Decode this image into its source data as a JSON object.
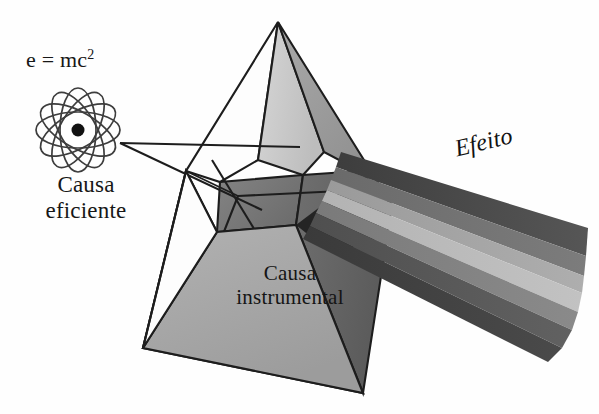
{
  "figure": {
    "background_color": "#fefefe",
    "line_color": "#1a1a1a",
    "text_color": "#171717"
  },
  "labels": {
    "formula_base": "e = mc",
    "formula_exponent": "2",
    "cause_line1": "Causa",
    "cause_line2": "eficiente",
    "instrumental_line1": "Causa",
    "instrumental_line2": "instrumental",
    "effect": "Efeito"
  },
  "atom": {
    "icon": "atom-icon",
    "center_x": 78,
    "center_y": 130,
    "orbit_count": 6,
    "orbit_rx": 42,
    "orbit_ry": 18,
    "orbit_color": "#3d3d3d",
    "nucleus_radius": 6.5,
    "nucleus_color": "#111111"
  },
  "prism": {
    "apex_x": 278,
    "apex_y": 22,
    "base_left_x": 143,
    "base_left_y": 348,
    "base_right_x": 363,
    "base_right_y": 393,
    "faces": [
      {
        "name": "upper-left-facet",
        "fill": "#ffffff"
      },
      {
        "name": "upper-mid-facet",
        "fill": "#c9c9c9"
      },
      {
        "name": "upper-right-facet",
        "fill": "#9a9a9a"
      },
      {
        "name": "mid-dark-facet",
        "fill": "#7a7a7a"
      },
      {
        "name": "front-base-facet",
        "fill": "#a8a8a8"
      },
      {
        "name": "left-white-facet",
        "fill": "#fdfdfd"
      },
      {
        "name": "shadow-facet",
        "fill": "#2b2b2b"
      }
    ]
  },
  "incident_ray": {
    "name": "incident-light-ray",
    "origin_x": 120,
    "origin_y": 143,
    "color": "#1a1a1a"
  },
  "spectrum_beam": {
    "name": "dispersed-spectrum-beam",
    "band_count": 6,
    "bands": [
      {
        "index": 0,
        "fill": "#4a4a4a"
      },
      {
        "index": 1,
        "fill": "#6e6e6e"
      },
      {
        "index": 2,
        "fill": "#9e9e9e"
      },
      {
        "index": 3,
        "fill": "#b5b5b5"
      },
      {
        "index": 4,
        "fill": "#7d7d7d"
      },
      {
        "index": 5,
        "fill": "#555555"
      },
      {
        "index": 6,
        "fill": "#3f3f3f"
      }
    ]
  }
}
